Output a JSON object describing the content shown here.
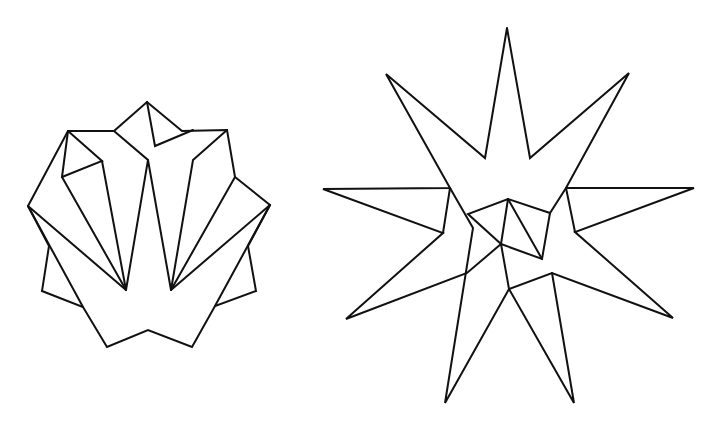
{
  "figures": [
    {
      "name": "folded-polygon-left",
      "stroke_color": "#111111",
      "polylines": [
        "28,206 68,131 114,131 147,102 182,131 227,130 235,177 270,205 248,246 256,291 215,306 192,347 148,330 107,347 83,307 42,291 49,246 28,206",
        "68,131 62,177",
        "68,131 102,161 62,177",
        "102,161 126,290",
        "62,177 126,290",
        "28,206 126,290",
        "114,131 148,160 126,290",
        "148,160 171,290",
        "147,102 155,146 193,130",
        "227,130 193,160 171,290",
        "235,177 171,290",
        "270,205 171,290",
        "28,206 83,307",
        "270,205 215,306"
      ]
    },
    {
      "name": "nine-point-star-right",
      "stroke_color": "#111111",
      "polylines": [
        "507,28 485,158 386,74 450,188 323,189 443,233 346,319 467,273 501,244 468,214 508,199 550,213 566,188 629,73 530,158 507,28",
        "566,188 694,188 575,232 673,318 552,273 509,289 445,403 473,228 450,188",
        "566,188 575,232",
        "450,188 443,233",
        "508,199 501,244 509,289 574,403 552,273",
        "501,244 542,259 550,213",
        "508,199 542,259"
      ]
    }
  ]
}
